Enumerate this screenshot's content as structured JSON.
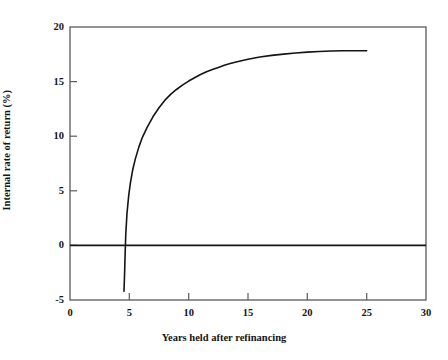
{
  "chart_data": {
    "type": "line",
    "title": "",
    "subtitle": "",
    "xlabel": "Years held after refinancing",
    "ylabel": "Internal rate of return (%)",
    "xlim": [
      0,
      30
    ],
    "ylim": [
      -5,
      20
    ],
    "xticks": [
      0,
      5,
      10,
      15,
      20,
      25,
      30
    ],
    "xtick_labels": [
      "0",
      "5",
      "10",
      "15",
      "20",
      "25",
      "30"
    ],
    "yticks": [
      -5,
      0,
      5,
      10,
      15,
      20
    ],
    "ytick_labels": [
      "-5",
      "0",
      "5",
      "10",
      "15",
      "20"
    ],
    "grid": false,
    "legend": null,
    "annotations": [],
    "reference_lines": [
      {
        "name": "zero-line",
        "orientation": "horizontal",
        "value": 0,
        "color": "#141414"
      }
    ],
    "series": [
      {
        "name": "Internal rate of return",
        "color": "#141414",
        "x": [
          4.55,
          4.6,
          4.65,
          4.7,
          4.8,
          4.95,
          5.1,
          5.3,
          5.5,
          5.8,
          6.1,
          6.5,
          7.0,
          7.5,
          8.0,
          8.5,
          9.0,
          9.5,
          10.0,
          10.5,
          11.0,
          11.5,
          12.0,
          12.5,
          13.0,
          13.5,
          14.0,
          15.0,
          16.0,
          17.0,
          18.0,
          19.0,
          20.0,
          21.0,
          22.0,
          23.0,
          24.0,
          25.0
        ],
        "y": [
          -4.2,
          -2.6,
          -0.6,
          1.0,
          2.9,
          4.6,
          5.8,
          7.0,
          7.9,
          9.0,
          9.9,
          10.8,
          11.8,
          12.6,
          13.3,
          13.85,
          14.3,
          14.7,
          15.05,
          15.35,
          15.65,
          15.9,
          16.1,
          16.3,
          16.5,
          16.65,
          16.8,
          17.05,
          17.25,
          17.4,
          17.52,
          17.62,
          17.7,
          17.75,
          17.8,
          17.82,
          17.83,
          17.82
        ]
      }
    ],
    "zero_crossing_x": 4.65,
    "plateau_value": 17.8,
    "min_value": -4.2
  },
  "axes": {
    "x_title": "Years held after refinancing",
    "y_title": "Internal rate of return (%)",
    "x_tick_labels": [
      "0",
      "5",
      "10",
      "15",
      "20",
      "25",
      "30"
    ],
    "y_tick_labels": [
      "20",
      "15",
      "10",
      "5",
      "0",
      "-5"
    ]
  },
  "colors": {
    "line": "#141414",
    "frame": "#5a5a5a",
    "zero_line": "#141414",
    "background": "#ffffff",
    "text": "#141414"
  }
}
